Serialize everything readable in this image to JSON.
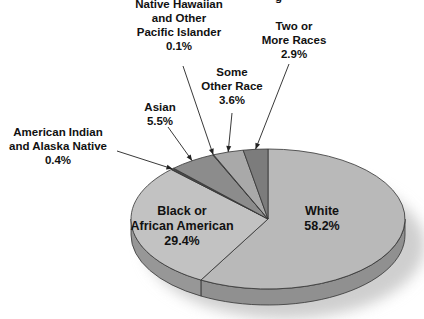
{
  "chart_data": {
    "type": "pie",
    "style": "3d-exploded-none",
    "title": "",
    "truncated_top_text": "g",
    "slices": [
      {
        "name": "White",
        "label_lines": [
          "White"
        ],
        "value": 58.2,
        "value_label": "58.2%",
        "color": "#b9b9b9",
        "label_position": "inside"
      },
      {
        "name": "Black or African American",
        "label_lines": [
          "Black or",
          "African American"
        ],
        "value": 29.4,
        "value_label": "29.4%",
        "color": "#c2c2c2",
        "label_position": "inside"
      },
      {
        "name": "American Indian and Alaska Native",
        "label_lines": [
          "American Indian",
          "and Alaska Native"
        ],
        "value": 0.4,
        "value_label": "0.4%",
        "color": "#4a4a4a",
        "label_position": "outside-left"
      },
      {
        "name": "Asian",
        "label_lines": [
          "Asian"
        ],
        "value": 5.5,
        "value_label": "5.5%",
        "color": "#8c8c8c",
        "label_position": "outside-top"
      },
      {
        "name": "Native Hawaiian and Other Pacific Islander",
        "label_lines": [
          "Native Hawaiian",
          "and Other",
          "Pacific Islander"
        ],
        "value": 0.1,
        "value_label": "0.1%",
        "color": "#6a6a6a",
        "label_position": "outside-top"
      },
      {
        "name": "Some Other Race",
        "label_lines": [
          "Some",
          "Other Race"
        ],
        "value": 3.6,
        "value_label": "3.6%",
        "color": "#a9a9a9",
        "label_position": "outside-top"
      },
      {
        "name": "Two or More Races",
        "label_lines": [
          "Two or",
          "More Races"
        ],
        "value": 2.9,
        "value_label": "2.9%",
        "color": "#7c7c7c",
        "label_position": "outside-top-right"
      }
    ],
    "legend": "none",
    "grid": false
  }
}
